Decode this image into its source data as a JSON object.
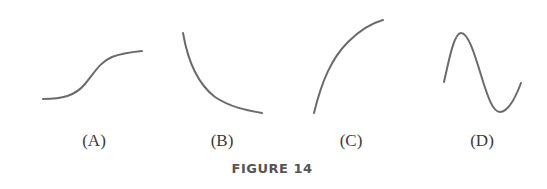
{
  "figure": {
    "caption": "FIGURE 14",
    "stroke_color": "#6b6b6b",
    "panels": [
      {
        "id": "A",
        "label": "(A)",
        "shape": "sigmoid (S-shaped, increasing)"
      },
      {
        "id": "B",
        "label": "(B)",
        "shape": "decreasing, concave up (decay)"
      },
      {
        "id": "C",
        "label": "(C)",
        "shape": "increasing, concave down"
      },
      {
        "id": "D",
        "label": "(D)",
        "shape": "sinusoidal (peak then trough)"
      }
    ]
  }
}
